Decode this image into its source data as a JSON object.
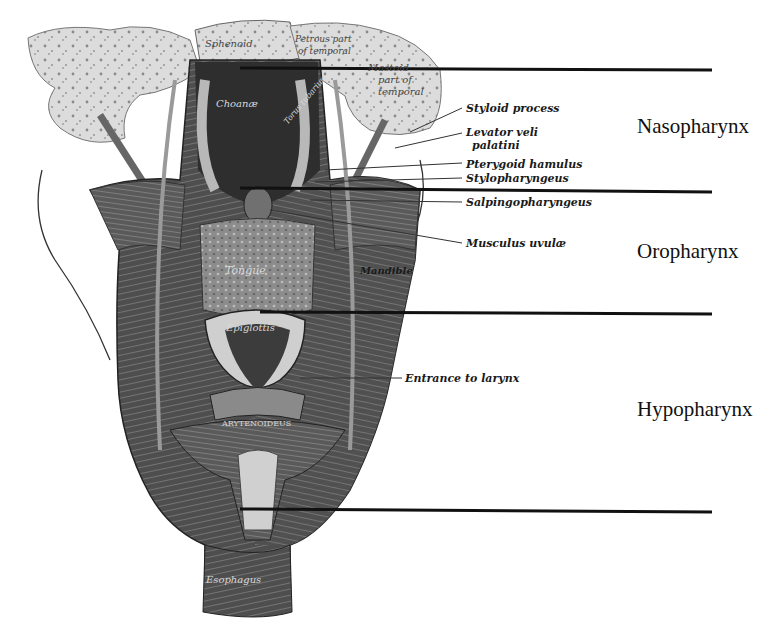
{
  "diagram": {
    "regions": [
      {
        "id": "nasopharynx",
        "label": "Nasopharynx"
      },
      {
        "id": "oropharynx",
        "label": "Oropharynx"
      },
      {
        "id": "hypopharynx",
        "label": "Hypopharynx"
      }
    ],
    "annotations": [
      {
        "id": "styloid-process",
        "label": "Styloid process"
      },
      {
        "id": "levator-veli-palatini-1",
        "label": "Levator veli"
      },
      {
        "id": "levator-veli-palatini-2",
        "label": "palatini"
      },
      {
        "id": "pterygoid-hamulus",
        "label": "Pterygoid hamulus"
      },
      {
        "id": "stylopharyngeus",
        "label": "Stylopharyngeus"
      },
      {
        "id": "salpingopharyngeus",
        "label": "Salpingopharyngeus"
      },
      {
        "id": "musculus-uvulae",
        "label": "Musculus uvulæ"
      },
      {
        "id": "mandible",
        "label": "Mandible"
      },
      {
        "id": "entrance-to-larynx",
        "label": "Entrance to larynx"
      }
    ],
    "inner_labels": {
      "sphenoid": "Sphenoid",
      "petrous_1": "Petrous part",
      "petrous_2": "of temporal",
      "mastoid_1": "Mastoid",
      "mastoid_2": "part of",
      "mastoid_3": "temporal",
      "choanae": "Choanæ",
      "torus": "Torus tubarius",
      "tongue": "Tongue",
      "epiglottis": "Epiglottis",
      "arytenoideus": "ARYTENOIDEUS",
      "esophagus": "Esophagus"
    },
    "colors": {
      "line": "#111111",
      "bone": "#d9d9d9",
      "muscle_dark": "#3a3a3a",
      "muscle_mid": "#6a6a6a"
    }
  }
}
